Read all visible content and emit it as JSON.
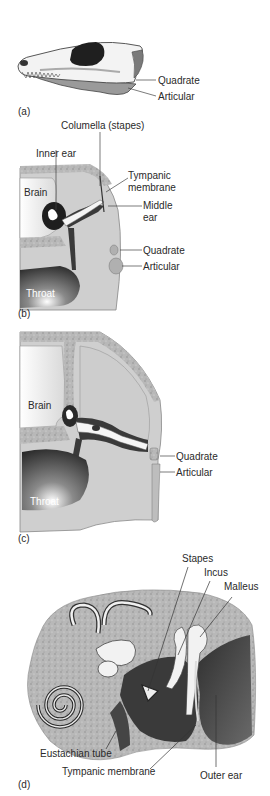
{
  "figure": {
    "colors": {
      "bone_light": "#f2f2f2",
      "tissue_gray": "#c9c9c9",
      "bone_speckle": "#a8a8a8",
      "dark": "#3a3a3a",
      "outline": "#555555"
    }
  },
  "panels": [
    {
      "id": "a",
      "label": "(a)",
      "annotations": [
        {
          "text": "Quadrate"
        },
        {
          "text": "Articular"
        }
      ]
    },
    {
      "id": "b",
      "label": "(b)",
      "annotations": [
        {
          "text": "Columella (stapes)"
        },
        {
          "text": "Inner ear"
        },
        {
          "text": "Brain"
        },
        {
          "text": "Tympanic"
        },
        {
          "text": "membrane"
        },
        {
          "text": "Middle"
        },
        {
          "text": "ear"
        },
        {
          "text": "Quadrate"
        },
        {
          "text": "Articular"
        },
        {
          "text": "Throat"
        }
      ]
    },
    {
      "id": "c",
      "label": "(c)",
      "annotations": [
        {
          "text": "Brain"
        },
        {
          "text": "Quadrate"
        },
        {
          "text": "Articular"
        },
        {
          "text": "Throat"
        }
      ]
    },
    {
      "id": "d",
      "label": "(d)",
      "annotations": [
        {
          "text": "Stapes"
        },
        {
          "text": "Incus"
        },
        {
          "text": "Malleus"
        },
        {
          "text": "Eustachian tube"
        },
        {
          "text": "Tympanic membrane"
        },
        {
          "text": "Outer ear"
        }
      ]
    }
  ]
}
